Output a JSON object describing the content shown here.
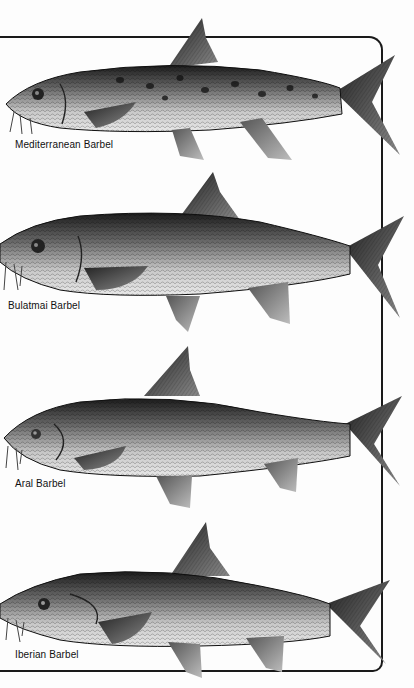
{
  "plate": {
    "frame_color": "#1a1a1a",
    "background": "#fdfdfd",
    "fish": [
      {
        "name": "Mediterranean Barbel",
        "label_x": 15,
        "label_y": 139,
        "spotted": true
      },
      {
        "name": "Bulatmai Barbel",
        "label_x": 8,
        "label_y": 300,
        "spotted": false
      },
      {
        "name": "Aral Barbel",
        "label_x": 15,
        "label_y": 478,
        "spotted": false
      },
      {
        "name": "Iberian Barbel",
        "label_x": 15,
        "label_y": 649,
        "spotted": false
      }
    ]
  }
}
